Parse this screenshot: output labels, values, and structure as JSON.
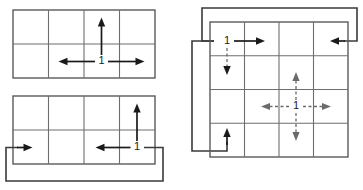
{
  "figure": {
    "name": "neighborhood-stencil-diagram",
    "background_color": "#ffffff",
    "grid_line_color": "#6e6e6e",
    "arrow_color": "#1a1a1a",
    "dashed_arrow_color": "#6b6b6b",
    "wrap_path_color": "#3a3a3a",
    "panels": [
      {
        "id": "panel-top-left",
        "name": "grid-4x2-open-boundary",
        "columns": 4,
        "rows": 2,
        "x": 13,
        "y": 10,
        "width": 142,
        "height": 68,
        "center_label": "1",
        "center_cell": {
          "col": 2,
          "row": 1
        },
        "arrows": [
          {
            "name": "arrow-up",
            "direction": "up",
            "style": "solid",
            "length": 1
          },
          {
            "name": "arrow-left",
            "direction": "left",
            "style": "solid",
            "length": 1
          },
          {
            "name": "arrow-right",
            "direction": "right",
            "style": "solid",
            "length": 1
          }
        ],
        "wraps": []
      },
      {
        "id": "panel-bottom-left",
        "name": "grid-4x2-periodic-horizontal",
        "columns": 4,
        "rows": 2,
        "x": 13,
        "y": 96,
        "width": 142,
        "height": 68,
        "center_label": "1",
        "center_cell": {
          "col": 3,
          "row": 1
        },
        "arrows": [
          {
            "name": "arrow-up",
            "direction": "up",
            "style": "solid",
            "length": 1
          },
          {
            "name": "arrow-left",
            "direction": "left",
            "style": "solid",
            "length": 1
          }
        ],
        "wraps": [
          {
            "name": "wrap-right-to-left",
            "axis": "horizontal",
            "enters_at": "left-edge",
            "exits_at": "right-edge"
          }
        ]
      },
      {
        "id": "panel-right",
        "name": "grid-4x4-periodic-both-axes",
        "columns": 4,
        "rows": 4,
        "x": 210,
        "y": 22,
        "width": 138,
        "height": 135,
        "corner_label": "1",
        "corner_cell": {
          "col": 0,
          "row": 0
        },
        "center_label": "1",
        "center_cell": {
          "col": 2,
          "row": 2
        },
        "arrows": [
          {
            "name": "corner-arrow-right",
            "direction": "right",
            "style": "solid",
            "length": 1
          },
          {
            "name": "corner-arrow-down",
            "direction": "down",
            "style": "dashed",
            "length": 1
          },
          {
            "name": "center-arrow-up",
            "direction": "up",
            "style": "dashed",
            "length": 1
          },
          {
            "name": "center-arrow-down",
            "direction": "down",
            "style": "dashed",
            "length": 1
          },
          {
            "name": "center-arrow-left",
            "direction": "left",
            "style": "dashed",
            "length": 1
          },
          {
            "name": "center-arrow-right",
            "direction": "right",
            "style": "dashed",
            "length": 1
          }
        ],
        "wraps": [
          {
            "name": "wrap-left-to-right",
            "axis": "horizontal",
            "enters_at": "top-left-cell",
            "exits_at": "top-right-cell"
          },
          {
            "name": "wrap-top-to-bottom",
            "axis": "vertical",
            "enters_at": "top-left-cell",
            "exits_at": "bottom-left-cell"
          }
        ]
      }
    ],
    "labels": {
      "unit": "1"
    }
  }
}
